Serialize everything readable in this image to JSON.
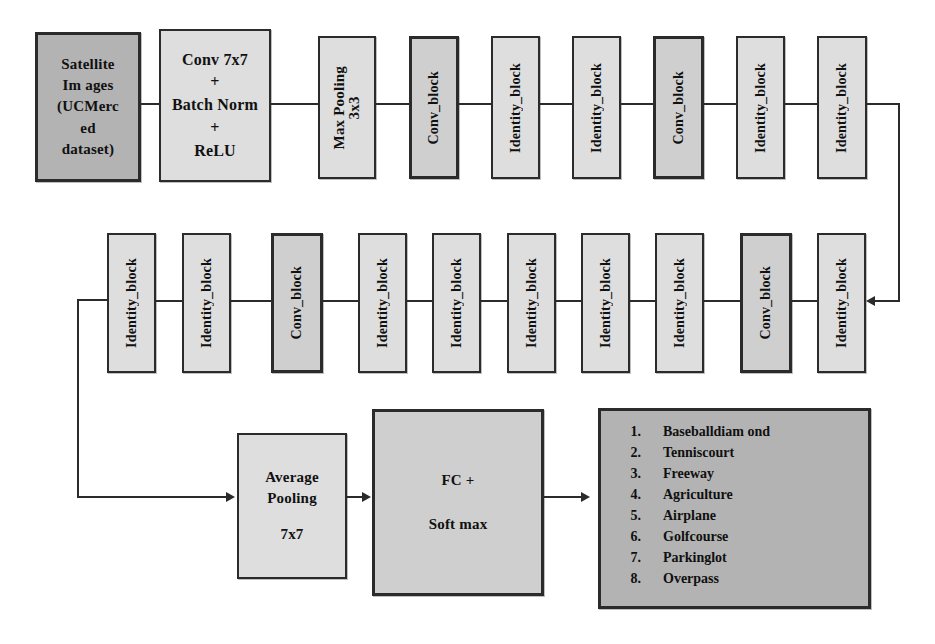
{
  "diagram": {
    "colors": {
      "input_fill": "#b3b3b3",
      "block_fill": "#d9d9d9",
      "output_fill": "#b3b3b3",
      "stroke": "#2b2b2b",
      "background": "#ffffff"
    },
    "input_block": {
      "lines": [
        "Satellite",
        "Im ages",
        "(UCMerc",
        "ed",
        "dataset)"
      ]
    },
    "stem_block": {
      "lines": [
        "Conv 7x7",
        "+",
        "Batch Norm",
        "+",
        "ReLU"
      ]
    },
    "pool_block": {
      "lines": [
        "Max Pooling",
        "3x3"
      ]
    },
    "row1_blocks": [
      {
        "label": "Conv_block"
      },
      {
        "label": "Identity_block"
      },
      {
        "label": "Identity_block"
      },
      {
        "label": "Conv_block"
      },
      {
        "label": "Identity_block"
      },
      {
        "label": "Identity_block"
      }
    ],
    "row2_blocks": [
      {
        "label": "Identity_block"
      },
      {
        "label": "Identity_block"
      },
      {
        "label": "Conv_block"
      },
      {
        "label": "Identity_block"
      },
      {
        "label": "Identity_block"
      },
      {
        "label": "Identity_block"
      },
      {
        "label": "Identity_block"
      },
      {
        "label": "Identity_block"
      },
      {
        "label": "Conv_block"
      },
      {
        "label": "Identity_block"
      }
    ],
    "avgpool_block": {
      "lines": [
        "Average",
        "Pooling",
        "7x7"
      ]
    },
    "fc_block": {
      "lines": [
        "FC +",
        "Soft max"
      ]
    },
    "classes": [
      "Baseballdiam ond",
      "Tenniscourt",
      "Freeway",
      "Agriculture",
      "Airplane",
      "Golfcourse",
      "Parkinglot",
      "Overpass"
    ]
  }
}
